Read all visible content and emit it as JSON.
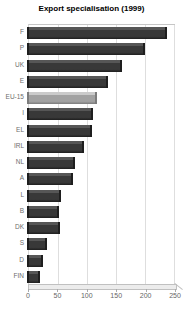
{
  "title": "Export specialisation (1999)",
  "chart_data": {
    "type": "bar",
    "orientation": "horizontal",
    "title": "Export specialisation (1999)",
    "xlabel": "",
    "ylabel": "",
    "categories": [
      "F",
      "P",
      "UK",
      "E",
      "EU-15",
      "I",
      "EL",
      "IRL",
      "NL",
      "A",
      "L",
      "B",
      "DK",
      "S",
      "D",
      "FIN"
    ],
    "values": [
      242,
      203,
      163,
      140,
      120,
      114,
      112,
      98,
      82,
      79,
      58,
      56,
      57,
      35,
      28,
      22
    ],
    "xlim": [
      0,
      250
    ],
    "xticks": [
      0,
      50,
      100,
      150,
      200,
      250
    ],
    "grid": true,
    "legend": "none",
    "highlight_category": "EU-15",
    "colors": {
      "bar": "#383838",
      "bar_top": "#565656",
      "bar_edge": "#1e1e1e",
      "highlight": "#a2a2a2",
      "highlight_top": "#cbcbcb",
      "highlight_edge": "#7c7c7c",
      "grid": "#dedede",
      "plot_border": "#c6c6c6",
      "floor": "#ececec",
      "tick_label": "#666666",
      "category_label": "#6e6e6e",
      "title": "#000000",
      "background": "#ffffff"
    }
  }
}
